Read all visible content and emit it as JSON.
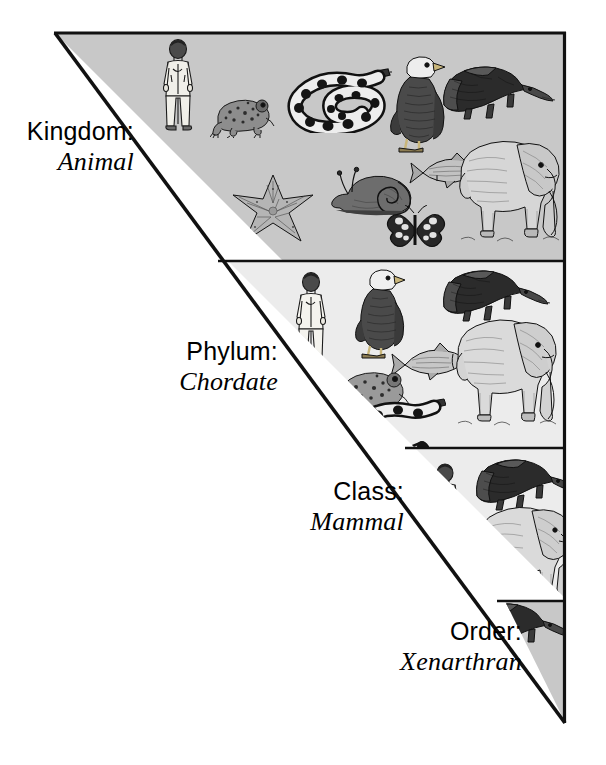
{
  "figure": {
    "type": "taxonomic-hierarchy-triangle",
    "shape": {
      "apex_top_left": [
        55,
        33
      ],
      "top_right": [
        565,
        33
      ],
      "bottom_point": [
        565,
        722
      ]
    },
    "colors": {
      "band_dark_gray": "#c8c8c8",
      "band_light_gray": "#ececec",
      "outline": "#111111",
      "text": "#000000",
      "page_background": "#ffffff"
    }
  },
  "ranks": [
    {
      "id": "kingdom",
      "rank_label": "Kingdom:",
      "taxon_value": "Animal",
      "band_top": 33,
      "band_bottom": 261,
      "background": "#c8c8c8",
      "organism_count": 10,
      "organisms": [
        "human",
        "frog",
        "snake",
        "eagle",
        "anteater",
        "fish",
        "elephant",
        "starfish",
        "snail",
        "butterfly"
      ]
    },
    {
      "id": "phylum",
      "rank_label": "Phylum:",
      "taxon_value": "Chordate",
      "band_top": 261,
      "band_bottom": 448,
      "background": "#ececec",
      "organism_count": 7,
      "organisms": [
        "human",
        "eagle",
        "anteater",
        "fish",
        "frog",
        "snake",
        "elephant"
      ]
    },
    {
      "id": "class",
      "rank_label": "Class:",
      "taxon_value": "Mammal",
      "band_top": 448,
      "band_bottom": 601,
      "background": "#ececec",
      "organism_count": 3,
      "organisms": [
        "human",
        "anteater",
        "elephant"
      ]
    },
    {
      "id": "order",
      "rank_label": "Order:",
      "taxon_value": "Xenarthran",
      "band_top": 601,
      "band_bottom": 722,
      "background": "#c8c8c8",
      "organism_count": 1,
      "organisms": [
        "anteater"
      ]
    }
  ]
}
